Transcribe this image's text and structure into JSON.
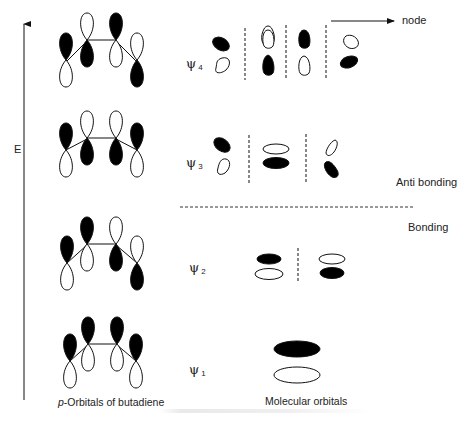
{
  "diagram": {
    "axis": {
      "label": "E",
      "direction": "up"
    },
    "node_annotation": {
      "label": "node"
    },
    "regions": {
      "antibonding_label": "Anti bonding",
      "bonding_label": "Bonding"
    },
    "column_captions": {
      "left_prefix": "p",
      "left_rest": "-Orbitals of butadiene",
      "right": "Molecular orbitals"
    },
    "levels": [
      {
        "id": "psi4",
        "symbol": "ψ",
        "index": "4",
        "nodes": 3,
        "p_orbital_top_phases": [
          "open",
          "open",
          "filled",
          "open"
        ]
      },
      {
        "id": "psi3",
        "symbol": "ψ",
        "index": "3",
        "nodes": 2,
        "p_orbital_top_phases": [
          "filled",
          "open",
          "open",
          "filled"
        ]
      },
      {
        "id": "psi2",
        "symbol": "ψ",
        "index": "2",
        "nodes": 1,
        "p_orbital_top_phases": [
          "filled",
          "filled",
          "open",
          "open"
        ]
      },
      {
        "id": "psi1",
        "symbol": "ψ",
        "index": "1",
        "nodes": 0,
        "p_orbital_top_phases": [
          "filled",
          "filled",
          "filled",
          "filled"
        ]
      }
    ],
    "colors": {
      "ink": "#111111",
      "fill": "#000000",
      "background": "#ffffff",
      "dash": "#333333"
    }
  }
}
